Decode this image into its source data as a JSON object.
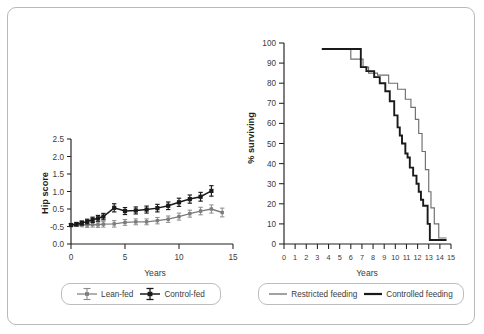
{
  "figure": {
    "panels": [
      "hip-score-panel",
      "survival-panel"
    ]
  },
  "chart_data": [
    {
      "type": "line",
      "id": "hip-score",
      "title": "",
      "xlabel": "Years",
      "ylabel": "Hip score",
      "xlim": [
        0,
        15
      ],
      "ylim": [
        -0.5,
        2.5
      ],
      "grid": false,
      "xticks": [
        0,
        5,
        10,
        15
      ],
      "xticklabels": [
        "0",
        "5",
        "10",
        "15"
      ],
      "yticks": [
        2.5,
        2.0,
        1.5,
        1.0,
        0.5,
        -0.5,
        0.0
      ],
      "yticklabels": [
        "2.5",
        "2.0",
        "1.5",
        "1.0",
        "0.5",
        "-0.5",
        "0.0"
      ],
      "legend_position": "below",
      "series": [
        {
          "name": "Lean-fed",
          "color": "#7c7c7c",
          "marker": "errorbar",
          "x": [
            0,
            0.5,
            1,
            1.5,
            2,
            2.5,
            3,
            4,
            5,
            6,
            7,
            8,
            9,
            10,
            11,
            12,
            13,
            14
          ],
          "values": [
            -0.45,
            -0.44,
            -0.44,
            -0.45,
            -0.43,
            -0.44,
            -0.42,
            -0.41,
            -0.36,
            -0.34,
            -0.34,
            -0.3,
            -0.25,
            -0.16,
            -0.06,
            0.03,
            0.1,
            -0.02
          ],
          "errors": [
            0.05,
            0.06,
            0.07,
            0.08,
            0.09,
            0.09,
            0.1,
            0.11,
            0.1,
            0.1,
            0.1,
            0.11,
            0.11,
            0.12,
            0.12,
            0.13,
            0.14,
            0.15
          ]
        },
        {
          "name": "Control-fed",
          "color": "#1a1a1a",
          "marker": "errorbar",
          "x": [
            0,
            0.5,
            1,
            1.5,
            2,
            2.5,
            3,
            4,
            5,
            6,
            7,
            8,
            9,
            10,
            11,
            12,
            13
          ],
          "values": [
            -0.45,
            -0.42,
            -0.38,
            -0.33,
            -0.27,
            -0.22,
            -0.16,
            0.14,
            0.03,
            0.05,
            0.08,
            0.13,
            0.21,
            0.33,
            0.44,
            0.52,
            0.72
          ],
          "errors": [
            0.05,
            0.06,
            0.07,
            0.08,
            0.09,
            0.1,
            0.11,
            0.14,
            0.12,
            0.12,
            0.12,
            0.13,
            0.13,
            0.14,
            0.14,
            0.15,
            0.18
          ]
        }
      ]
    },
    {
      "type": "line",
      "id": "survival",
      "title": "",
      "xlabel": "Years",
      "ylabel": "% surviving",
      "xlim": [
        0,
        15
      ],
      "ylim": [
        0,
        100
      ],
      "grid": false,
      "xticks": [
        0,
        1,
        2,
        3,
        4,
        5,
        6,
        7,
        8,
        9,
        10,
        11,
        12,
        13,
        14,
        15
      ],
      "xticklabels": [
        "0",
        "1",
        "2",
        "3",
        "4",
        "5",
        "6",
        "7",
        "8",
        "9",
        "10",
        "11",
        "12",
        "13",
        "14",
        "15"
      ],
      "yticks": [
        0,
        10,
        20,
        30,
        40,
        50,
        60,
        70,
        80,
        90,
        100
      ],
      "yticklabels": [
        "0",
        "10",
        "20",
        "30",
        "40",
        "50",
        "60",
        "70",
        "80",
        "90",
        "100"
      ],
      "legend_position": "below",
      "series": [
        {
          "name": "Restricted feeding",
          "color": "#6e6e6e",
          "style": "step",
          "x": [
            3.4,
            6.0,
            6.0,
            7.1,
            7.1,
            7.6,
            7.6,
            8.4,
            8.4,
            9.4,
            9.4,
            10.2,
            10.2,
            10.9,
            10.9,
            11.4,
            11.4,
            11.8,
            11.8,
            12.1,
            12.1,
            12.4,
            12.4,
            12.7,
            12.7,
            13.0,
            13.0,
            13.2,
            13.2,
            13.5,
            13.5,
            13.9,
            13.9,
            14.6
          ],
          "values": [
            97,
            97,
            92,
            92,
            88,
            88,
            85,
            85,
            84,
            84,
            80,
            80,
            77,
            77,
            72,
            72,
            68,
            68,
            62,
            62,
            55,
            55,
            46,
            46,
            37,
            37,
            26,
            26,
            18,
            18,
            10,
            10,
            3,
            3
          ]
        },
        {
          "name": "Controlled feeding",
          "color": "#1a1a1a",
          "style": "step",
          "x": [
            3.4,
            6.9,
            6.9,
            7.4,
            7.4,
            8.1,
            8.1,
            8.6,
            8.6,
            9.1,
            9.1,
            9.5,
            9.5,
            9.9,
            9.9,
            10.2,
            10.2,
            10.4,
            10.4,
            10.6,
            10.6,
            10.9,
            10.9,
            11.1,
            11.1,
            11.3,
            11.3,
            11.6,
            11.6,
            11.9,
            11.9,
            12.1,
            12.1,
            12.3,
            12.3,
            12.5,
            12.5,
            12.7,
            12.7,
            12.9,
            12.9,
            13.1,
            13.1,
            14.6
          ],
          "values": [
            97,
            97,
            88,
            88,
            86,
            86,
            83,
            83,
            80,
            80,
            76,
            76,
            71,
            71,
            64,
            64,
            58,
            58,
            54,
            54,
            50,
            50,
            45,
            45,
            43,
            43,
            38,
            38,
            34,
            34,
            30,
            30,
            26,
            26,
            22,
            22,
            19,
            19,
            19,
            19,
            10,
            10,
            2,
            2
          ]
        }
      ]
    }
  ],
  "legends": {
    "left": {
      "items": [
        {
          "label": "Lean-fed",
          "color": "#7c7c7c",
          "marker": "errorbar-marker"
        },
        {
          "label": "Control-fed",
          "color": "#1a1a1a",
          "marker": "errorbar-marker"
        }
      ]
    },
    "right": {
      "items": [
        {
          "label": "Restricted feeding",
          "color": "#6e6e6e",
          "marker": "thin-line-marker"
        },
        {
          "label": "Controlled feeding",
          "color": "#1a1a1a",
          "marker": "thick-line-marker"
        }
      ]
    }
  }
}
